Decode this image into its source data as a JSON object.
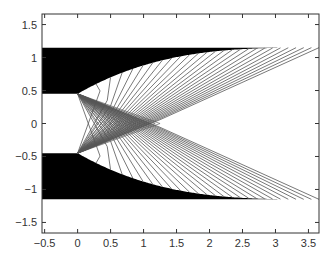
{
  "chart_data": {
    "type": "line",
    "title": "",
    "xlabel": "",
    "ylabel": "",
    "xlim": [
      -0.54,
      3.66
    ],
    "ylim": [
      -1.66,
      1.66
    ],
    "grid": false,
    "legend": null,
    "x_ticks": [
      -0.5,
      0,
      0.5,
      1,
      1.5,
      2,
      2.5,
      3,
      3.5
    ],
    "x_tick_labels": [
      "−0.5",
      "0",
      "0.5",
      "1",
      "1.5",
      "2",
      "2.5",
      "3",
      "3.5"
    ],
    "y_ticks": [
      1.5,
      1,
      0.5,
      0,
      -0.5,
      -1,
      -1.5
    ],
    "y_tick_labels": [
      "1.5",
      "1",
      "0.5",
      "0",
      "−0.5",
      "−1",
      "−1.5"
    ],
    "wall": {
      "outer_y": 1.15,
      "throat_y": 0.45,
      "throat_x": 0,
      "exit_x": 3.66,
      "exit_y": 1.15,
      "profile_points": [
        [
          0,
          0.45
        ],
        [
          0.42,
          0.665
        ],
        [
          0.64,
          0.76
        ],
        [
          1.0,
          0.87
        ],
        [
          1.5,
          0.99
        ],
        [
          2.3,
          1.11
        ],
        [
          3.0,
          1.144
        ],
        [
          3.66,
          1.15
        ]
      ]
    },
    "characteristics": {
      "count_per_side": 26,
      "corner_points": [
        [
          0,
          0.45
        ],
        [
          0,
          -0.45
        ]
      ],
      "centerline_focus_x": 1.25,
      "wall_end_x_range": [
        0.28,
        3.66
      ]
    },
    "colors": {
      "wall_fill": "#000000",
      "line": "#555555",
      "axis": "#333333",
      "background": "#ffffff"
    }
  }
}
